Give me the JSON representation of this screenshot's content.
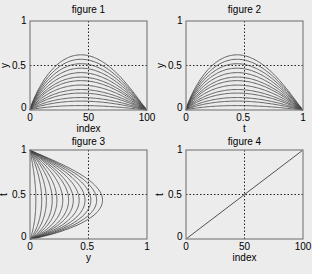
{
  "figure": {
    "background": "#ececec",
    "axes_color": "#808080",
    "line_color": "#404040",
    "grid_style": "dotted"
  },
  "chart_data": [
    {
      "type": "line",
      "title": "figure 1",
      "xlabel": "index",
      "ylabel": "y",
      "xlim": [
        0,
        100
      ],
      "ylim": [
        0,
        1
      ],
      "xticks": [
        "0",
        "50",
        "100"
      ],
      "yticks": [
        "0",
        "0.5",
        "1"
      ],
      "grid": "crosshair at x=50, y=0.5",
      "series_count": 13,
      "description": "Family of 13 hump-shaped curves from 0 to 0 over index 0..100, peaks near index ~43, max peak ≈0.62, evenly spaced down to ≈0.05",
      "peaks": [
        0.62,
        0.57,
        0.52,
        0.47,
        0.42,
        0.37,
        0.33,
        0.28,
        0.23,
        0.19,
        0.14,
        0.1,
        0.05
      ]
    },
    {
      "type": "line",
      "title": "figure 2",
      "xlabel": "t",
      "ylabel": "y",
      "xlim": [
        0,
        1
      ],
      "ylim": [
        0,
        1
      ],
      "xticks": [
        "0",
        "0.5",
        "1"
      ],
      "yticks": [
        "0",
        "0.5",
        "1"
      ],
      "grid": "crosshair at x=0.5, y=0.5",
      "series_count": 13,
      "description": "Same curve family as figure 1 plotted against t in [0,1]",
      "peaks": [
        0.62,
        0.57,
        0.52,
        0.47,
        0.42,
        0.37,
        0.33,
        0.28,
        0.23,
        0.19,
        0.14,
        0.1,
        0.05
      ]
    },
    {
      "type": "line",
      "title": "figure 3",
      "xlabel": "y",
      "ylabel": "t",
      "xlim": [
        0,
        1
      ],
      "ylim": [
        0,
        1
      ],
      "xticks": [
        "0",
        "0.5",
        "1"
      ],
      "yticks": [
        "0",
        "0.5",
        "1"
      ],
      "grid": "crosshair at x=0.5, y=0.5",
      "series_count": 13,
      "description": "Curve family transposed: t vs y, bulging rightward with max y ≈0.62 near t ≈0.43",
      "peaks": [
        0.62,
        0.57,
        0.52,
        0.47,
        0.42,
        0.37,
        0.33,
        0.28,
        0.23,
        0.19,
        0.14,
        0.1,
        0.05
      ]
    },
    {
      "type": "line",
      "title": "figure 4",
      "xlabel": "index",
      "ylabel": "t",
      "xlim": [
        0,
        100
      ],
      "ylim": [
        0,
        1
      ],
      "xticks": [
        "0",
        "50",
        "100"
      ],
      "yticks": [
        "0",
        "0.5",
        "1"
      ],
      "grid": "crosshair at x=50, y=0.5",
      "series": [
        {
          "name": "t",
          "x": [
            0,
            50,
            100
          ],
          "y": [
            0,
            0.5,
            1
          ]
        }
      ]
    }
  ]
}
